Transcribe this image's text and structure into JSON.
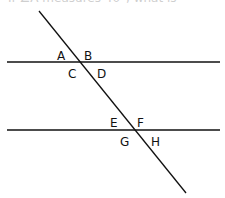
{
  "caption": "If ∠A measures 40°, what is",
  "diagram": {
    "stroke_color": "#111111",
    "lines": [
      {
        "id": "top-parallel",
        "x1": 7,
        "y1": 62,
        "x2": 220,
        "y2": 62
      },
      {
        "id": "bottom-parallel",
        "x1": 7,
        "y1": 130,
        "x2": 220,
        "y2": 130
      },
      {
        "id": "transversal",
        "x1": 39,
        "y1": 11,
        "x2": 186,
        "y2": 193
      }
    ],
    "labels": [
      {
        "text": "A",
        "x": 57,
        "y": 60
      },
      {
        "text": "B",
        "x": 84,
        "y": 60
      },
      {
        "text": "C",
        "x": 68,
        "y": 78
      },
      {
        "text": "D",
        "x": 97,
        "y": 78
      },
      {
        "text": "E",
        "x": 110,
        "y": 127
      },
      {
        "text": "F",
        "x": 137,
        "y": 127
      },
      {
        "text": "G",
        "x": 120,
        "y": 146
      },
      {
        "text": "H",
        "x": 151,
        "y": 146
      }
    ]
  }
}
